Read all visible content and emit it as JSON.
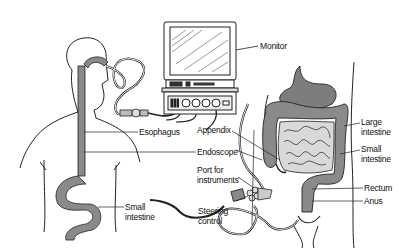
{
  "diagram": {
    "labels": {
      "monitor": "Monitor",
      "esophagus": "Esophagus",
      "endoscope": "Endoscope",
      "small_intestine_left": "Small\nintestine",
      "appendix": "Appendix",
      "port_for_instruments": "Port for\ninstruments",
      "steering_control": "Steering\ncontrol",
      "large_intestine": "Large\nintestine",
      "small_intestine_right": "Small\nintestine",
      "rectum": "Rectum",
      "anus": "Anus"
    },
    "colors": {
      "line": "#222222",
      "organ_fill": "#8a8a8a",
      "organ_light": "#b5b5b5",
      "background": "#ffffff"
    }
  }
}
